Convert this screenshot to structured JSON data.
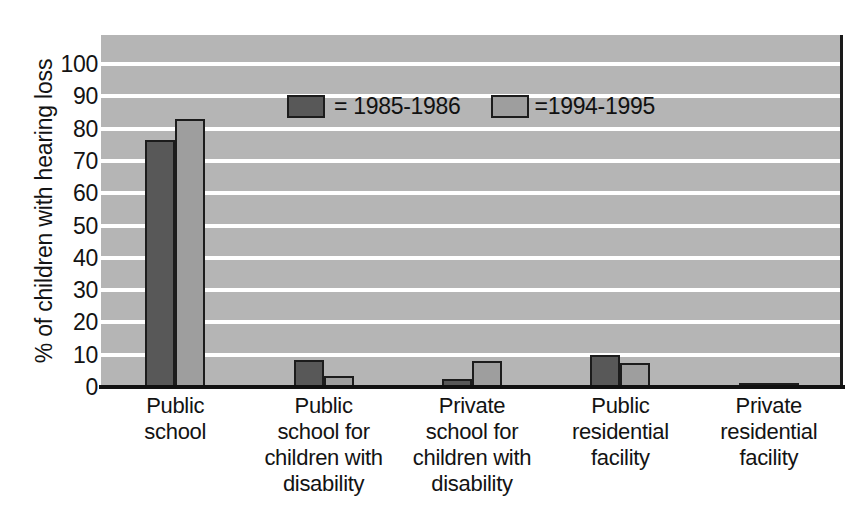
{
  "chart_data": {
    "type": "bar",
    "title": "",
    "xlabel": "",
    "ylabel": "% of children with hearing loss",
    "ylim": [
      0,
      100
    ],
    "yticks": [
      100,
      90,
      80,
      70,
      60,
      50,
      40,
      30,
      20,
      10,
      0
    ],
    "grid": true,
    "legend_position": "inside-top-center",
    "categories": [
      "Public\nschool",
      "Public\nschool for\nchildren with\ndisability",
      "Private\nschool for\nchildren with\ndisability",
      "Public\nresidential\nfacility",
      "Private\nresidential\nfacility"
    ],
    "category_lines": [
      [
        "Public",
        "school"
      ],
      [
        "Public",
        "school for",
        "children with",
        "disability"
      ],
      [
        "Private",
        "school for",
        "children with",
        "disability"
      ],
      [
        "Public",
        "residential",
        "facility"
      ],
      [
        "Private",
        "residential",
        "facility"
      ]
    ],
    "series": [
      {
        "name": "= 1985-1986",
        "color": "#585858",
        "values": [
          76.5,
          8.5,
          2.5,
          10,
          1
        ]
      },
      {
        "name": "=1994-1995",
        "color": "#9e9e9e",
        "values": [
          83,
          3.5,
          8,
          7.5,
          1
        ]
      }
    ]
  },
  "legend": {
    "entries": [
      {
        "label": "= 1985-1986",
        "swatch": "#585858"
      },
      {
        "label": "=1994-1995",
        "swatch": "#9e9e9e"
      }
    ]
  },
  "colors": {
    "plot_background": "#b5b5b5",
    "gridline": "#ffffff",
    "axis": "#111111",
    "series_1985": "#585858",
    "series_1994": "#9e9e9e"
  }
}
